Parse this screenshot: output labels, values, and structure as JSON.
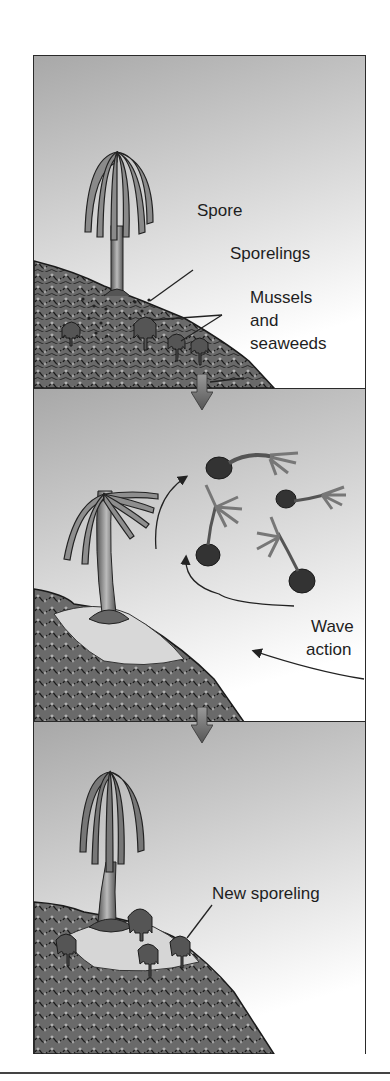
{
  "figure": {
    "panels": [
      {
        "id": "stage-1",
        "labels": {
          "spore": "Spore",
          "sporelings": "Sporelings",
          "mussels_line1": "Mussels",
          "mussels_line2": "and",
          "mussels_line3": "seaweeds"
        }
      },
      {
        "id": "stage-2",
        "labels": {
          "wave_line1": "Wave",
          "wave_line2": "action"
        }
      },
      {
        "id": "stage-3",
        "labels": {
          "new_sporeling": "New sporeling"
        }
      }
    ],
    "step_arrows": [
      "down-arrow",
      "down-arrow"
    ],
    "colors": {
      "sky_top": "#a9a9a9",
      "sky_bottom": "#ffffff",
      "ink": "#1e1e1e",
      "rock_fill": "#7a7a7a",
      "arrow_fill": "#6e6e6e"
    }
  }
}
